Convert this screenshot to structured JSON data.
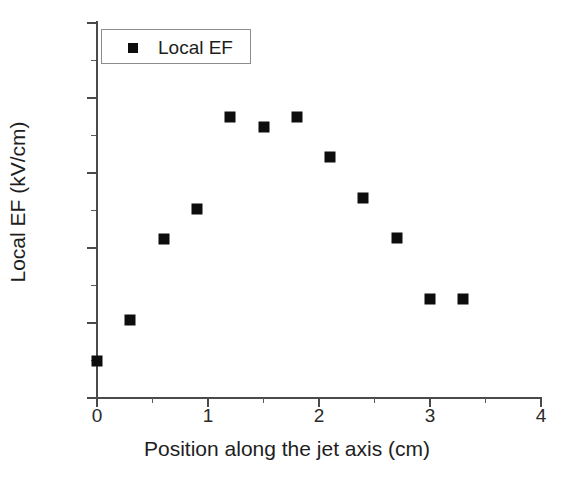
{
  "chart_data": {
    "type": "scatter",
    "title": "",
    "xlabel": "Position along the jet axis (cm)",
    "ylabel": "Local EF (kV/cm)",
    "xlim": [
      0,
      4
    ],
    "ylim": [
      20,
      120
    ],
    "grid": false,
    "legend_position": "top-left",
    "x_major_ticks": [
      0,
      1,
      2,
      3,
      4
    ],
    "x_minor_ticks": [
      0.5,
      1.5,
      2.5,
      3.5
    ],
    "x_tick_labels": [
      "0",
      "1",
      "2",
      "3",
      "4"
    ],
    "y_major_ticks": [
      20,
      40,
      60,
      80,
      100,
      120
    ],
    "y_minor_ticks": [
      30,
      50,
      70,
      90,
      110
    ],
    "y_tick_labels": [
      "20",
      "40",
      "60",
      "80",
      "100",
      "120"
    ],
    "marker_color": "#0d0d0d",
    "marker_shape": "square",
    "series": [
      {
        "name": "Local EF",
        "x": [
          0.0,
          0.3,
          0.6,
          0.9,
          1.2,
          1.5,
          1.8,
          2.1,
          2.4,
          2.7,
          3.0,
          3.3
        ],
        "values": [
          30.0,
          40.7,
          62.3,
          70.5,
          95.0,
          92.2,
          95.0,
          84.3,
          73.4,
          62.7,
          46.5,
          46.5
        ]
      }
    ]
  },
  "legend": {
    "entries": [
      {
        "label": "Local EF",
        "marker": "square-marker",
        "color": "#0d0d0d"
      }
    ]
  }
}
